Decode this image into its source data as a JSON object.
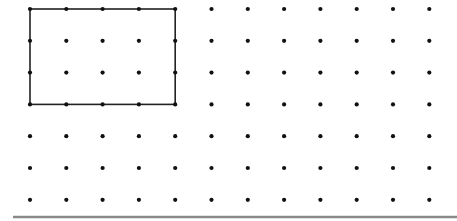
{
  "diagram": {
    "type": "dot-grid",
    "grid": {
      "columns": 12,
      "rows": 7,
      "origin_x": 30,
      "origin_y": 9,
      "spacing_x": 36.3,
      "spacing_y": 31.8,
      "dot_radius": 2.1,
      "dot_color": "#111111"
    },
    "rectangle": {
      "from_col": 0,
      "to_col": 4,
      "from_row": 0,
      "to_row": 3,
      "width_units": 4,
      "height_units": 3,
      "stroke_color": "#222222",
      "stroke_width": 1.6
    },
    "baseline": {
      "x1": 13,
      "x2": 457,
      "y": 217,
      "color": "#8a8a8a",
      "thickness": 2.5
    }
  }
}
